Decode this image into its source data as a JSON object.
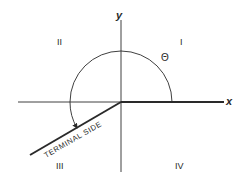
{
  "diagram": {
    "axes": {
      "x_label": "x",
      "y_label": "y"
    },
    "quadrants": {
      "q1": "I",
      "q2": "II",
      "q3": "III",
      "q4": "IV"
    },
    "angle_label": "Θ",
    "terminal_side_label": "TERMINAL SIDE",
    "colors": {
      "ink": "#2a2a2a",
      "background": "#ffffff"
    }
  }
}
